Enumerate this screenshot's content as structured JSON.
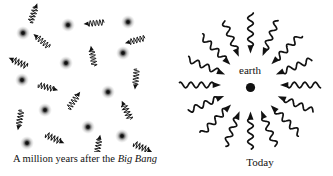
{
  "colors": {
    "background": "#ffffff",
    "ink": "#111111"
  },
  "left_panel": {
    "caption_prefix": "A million years after the ",
    "caption_italic": "Big Bang",
    "atoms": [
      {
        "x": 23,
        "y": 33
      },
      {
        "x": 68,
        "y": 25
      },
      {
        "x": 128,
        "y": 22
      },
      {
        "x": 66,
        "y": 63
      },
      {
        "x": 123,
        "y": 53
      },
      {
        "x": 22,
        "y": 80
      },
      {
        "x": 45,
        "y": 110
      },
      {
        "x": 108,
        "y": 92
      },
      {
        "x": 88,
        "y": 127
      },
      {
        "x": 27,
        "y": 143
      },
      {
        "x": 122,
        "y": 136
      }
    ],
    "photons": [
      {
        "x": 33,
        "y": 15,
        "angle": 70
      },
      {
        "x": 43,
        "y": 42,
        "angle": 140
      },
      {
        "x": 20,
        "y": 63,
        "angle": 155
      },
      {
        "x": 96,
        "y": 23,
        "angle": 185
      },
      {
        "x": 137,
        "y": 40,
        "angle": 195
      },
      {
        "x": 93,
        "y": 58,
        "angle": 100
      },
      {
        "x": 136,
        "y": 77,
        "angle": 265
      },
      {
        "x": 46,
        "y": 87,
        "angle": 345
      },
      {
        "x": 73,
        "y": 102,
        "angle": 55
      },
      {
        "x": 20,
        "y": 118,
        "angle": 260
      },
      {
        "x": 53,
        "y": 138,
        "angle": 335
      },
      {
        "x": 98,
        "y": 147,
        "angle": 80
      },
      {
        "x": 127,
        "y": 112,
        "angle": 115
      },
      {
        "x": 141,
        "y": 147,
        "angle": 335
      }
    ],
    "photon_style": {
      "length": 16,
      "amplitude": 3,
      "wavelength": 3.2,
      "stroke_width": 0.9,
      "arrow_len": 4.5,
      "arrow_half_width": 2.2
    }
  },
  "right_panel": {
    "earth_label": "earth",
    "caption": "Today",
    "center": {
      "x": 80.5,
      "y": 85
    },
    "earth": {
      "x": 80.5,
      "y": 87.5,
      "radius": 4.6
    },
    "photons": [
      {
        "angle": 0,
        "inner": 36,
        "outer": 70
      },
      {
        "angle": 22.5,
        "inner": 34,
        "outer": 66
      },
      {
        "angle": 45,
        "inner": 36,
        "outer": 71
      },
      {
        "angle": 67.5,
        "inner": 38,
        "outer": 70
      },
      {
        "angle": 90,
        "inner": 38,
        "outer": 72
      },
      {
        "angle": 112.5,
        "inner": 37,
        "outer": 69
      },
      {
        "angle": 135,
        "inner": 35,
        "outer": 70
      },
      {
        "angle": 157.5,
        "inner": 34,
        "outer": 68
      },
      {
        "angle": 180,
        "inner": 36,
        "outer": 71
      },
      {
        "angle": 202.5,
        "inner": 35,
        "outer": 67
      },
      {
        "angle": 225,
        "inner": 34,
        "outer": 69
      },
      {
        "angle": 247.5,
        "inner": 35,
        "outer": 66
      },
      {
        "angle": 270,
        "inner": 33,
        "outer": 64
      },
      {
        "angle": 292.5,
        "inner": 34,
        "outer": 66
      },
      {
        "angle": 315,
        "inner": 35,
        "outer": 70
      },
      {
        "angle": 337.5,
        "inner": 36,
        "outer": 68
      }
    ],
    "photon_style": {
      "amplitude": 2.8,
      "wavelength": 10.5,
      "stroke_width": 1.7,
      "arrow_len": 6.5,
      "arrow_half_width": 3
    }
  }
}
